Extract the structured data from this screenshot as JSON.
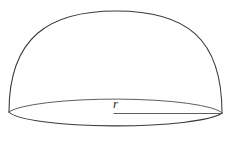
{
  "figure": {
    "kind": "hemisphere-volume-diagram",
    "background_color": "#ffffff",
    "stroke_color": "#3a3a3a",
    "stroke_color_light": "#585858",
    "stroke_width": 1.05,
    "labels": {
      "radius": "r"
    },
    "geometry": {
      "base_center_x": 114,
      "base_center_y": 113,
      "base_semi_major": 108,
      "base_semi_minor": 16,
      "dome_apex_x": 116,
      "dome_apex_y": 11,
      "dome_left_x": 9,
      "dome_left_y": 112,
      "dome_right_x": 222,
      "dome_right_y": 113,
      "radius_line_x1": 114,
      "radius_line_y1": 113,
      "radius_line_x2": 222,
      "radius_line_y2": 113
    }
  },
  "chart_data": {
    "type": "diagram",
    "title": "",
    "shapes": [
      {
        "name": "dome-arc",
        "role": "outline of the hemispherical surface",
        "path": "semi-ellipse from left base vertex over apex to right base vertex"
      },
      {
        "name": "base-ellipse-front",
        "role": "visible near half of the circular base rim",
        "path": "lower half of ellipse"
      },
      {
        "name": "base-ellipse-back",
        "role": "far half of the circular base rim seen through the solid",
        "path": "upper half of ellipse"
      },
      {
        "name": "radius-segment",
        "role": "radius from base center to base rim",
        "label": "r"
      }
    ],
    "annotations": [
      {
        "text": "r",
        "x": 120,
        "y": 104,
        "style": "italic"
      }
    ]
  }
}
